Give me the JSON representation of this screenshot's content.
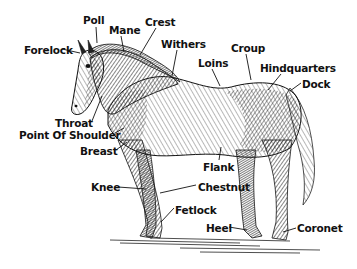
{
  "diagram": {
    "colors": {
      "ink": "#111111",
      "background": "#ffffff",
      "hatch": "#222222"
    },
    "labels": [
      {
        "id": "poll",
        "text": "Poll",
        "x": 83,
        "y": 14
      },
      {
        "id": "mane",
        "text": "Mane",
        "x": 109,
        "y": 24
      },
      {
        "id": "crest",
        "text": "Crest",
        "x": 145,
        "y": 16
      },
      {
        "id": "forelock",
        "text": "Forelock",
        "x": 24,
        "y": 44
      },
      {
        "id": "withers",
        "text": "Withers",
        "x": 161,
        "y": 38
      },
      {
        "id": "croup",
        "text": "Croup",
        "x": 231,
        "y": 42
      },
      {
        "id": "loins",
        "text": "Loins",
        "x": 198,
        "y": 57
      },
      {
        "id": "hindquarters",
        "text": "Hindquarters",
        "x": 260,
        "y": 62
      },
      {
        "id": "dock",
        "text": "Dock",
        "x": 302,
        "y": 78
      },
      {
        "id": "throat",
        "text": "Throat",
        "x": 55,
        "y": 117
      },
      {
        "id": "point-of-shoulder",
        "text": "Point Of Shoulder",
        "x": 19,
        "y": 129
      },
      {
        "id": "breast",
        "text": "Breast",
        "x": 80,
        "y": 145
      },
      {
        "id": "flank",
        "text": "Flank",
        "x": 203,
        "y": 161
      },
      {
        "id": "knee",
        "text": "Knee",
        "x": 91,
        "y": 181
      },
      {
        "id": "chestnut",
        "text": "Chestnut",
        "x": 198,
        "y": 181
      },
      {
        "id": "fetlock",
        "text": "Fetlock",
        "x": 175,
        "y": 204
      },
      {
        "id": "heel",
        "text": "Heel",
        "x": 206,
        "y": 222
      },
      {
        "id": "coronet",
        "text": "Coronet",
        "x": 297,
        "y": 222
      }
    ]
  }
}
